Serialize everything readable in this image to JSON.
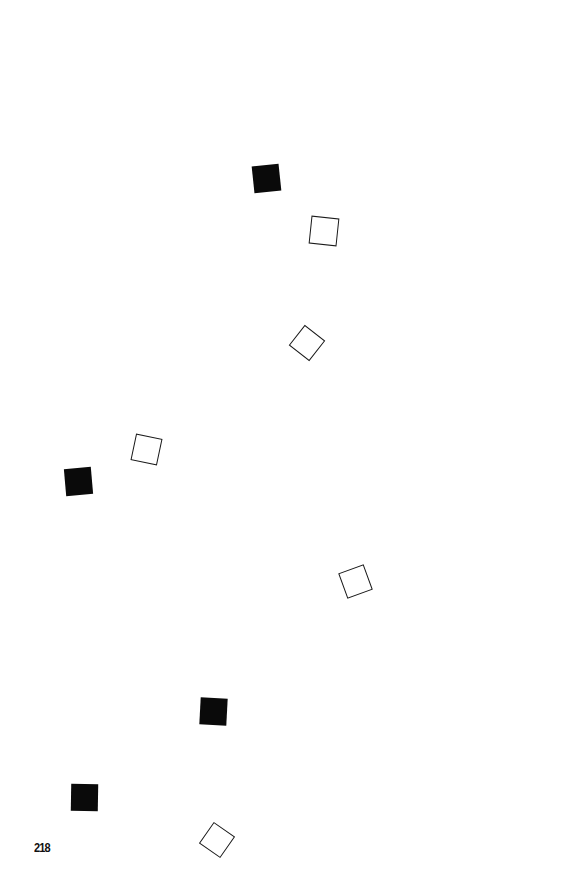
{
  "page": {
    "page_number": "218",
    "background_color": "#ffffff",
    "ink_color": "#0a0a0a"
  },
  "shapes": [
    {
      "id": "filled-1",
      "type": "filled-square",
      "cx": 266,
      "cy": 178,
      "size": 27,
      "rotation": -6
    },
    {
      "id": "outline-1",
      "type": "outline-square",
      "cx": 324,
      "cy": 231,
      "size": 28,
      "rotation": 6
    },
    {
      "id": "outline-2",
      "type": "outline-square",
      "cx": 307,
      "cy": 343,
      "size": 26,
      "rotation": 38
    },
    {
      "id": "outline-3",
      "type": "outline-square",
      "cx": 146,
      "cy": 449,
      "size": 27,
      "rotation": 12
    },
    {
      "id": "filled-2",
      "type": "filled-square",
      "cx": 78,
      "cy": 481,
      "size": 27,
      "rotation": -5
    },
    {
      "id": "outline-4",
      "type": "outline-square",
      "cx": 355,
      "cy": 581,
      "size": 27,
      "rotation": -20
    },
    {
      "id": "filled-3",
      "type": "filled-square",
      "cx": 213,
      "cy": 711,
      "size": 27,
      "rotation": 3
    },
    {
      "id": "filled-4",
      "type": "filled-square",
      "cx": 84,
      "cy": 797,
      "size": 27,
      "rotation": 1
    },
    {
      "id": "outline-5",
      "type": "outline-square",
      "cx": 217,
      "cy": 840,
      "size": 26,
      "rotation": 35
    }
  ]
}
